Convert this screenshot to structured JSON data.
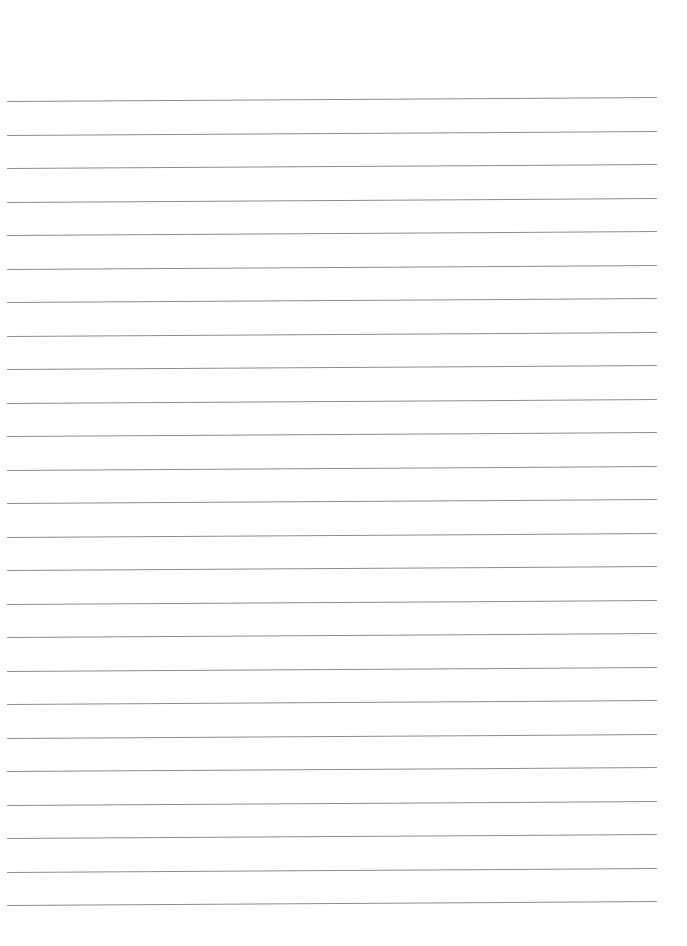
{
  "page": {
    "type": "blank lined paper",
    "background_color": "#ffffff",
    "line_color": "#8c8c8c",
    "line_count": 25,
    "first_line_y": 101,
    "line_spacing": 33.5,
    "line_left_x": 7,
    "line_right_x": 657
  }
}
